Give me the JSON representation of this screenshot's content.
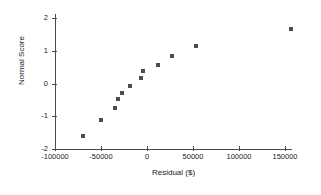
{
  "chart_data": {
    "type": "scatter",
    "title": "",
    "subtitle": "",
    "xlabel": "Residual ($)",
    "ylabel": "Normal Score",
    "xlim": [
      -100000,
      170000
    ],
    "ylim": [
      -2,
      2
    ],
    "xticks": [
      -100000,
      -50000,
      0,
      50000,
      100000,
      150000
    ],
    "xtick_labels": [
      "-100000",
      "-50000",
      "0",
      "50000",
      "100000",
      "150000"
    ],
    "yticks": [
      -2,
      -1,
      0,
      1,
      2
    ],
    "ytick_labels": [
      "-2",
      "-1",
      "0",
      "1",
      "2"
    ],
    "grid": false,
    "legend": null,
    "marker": "square",
    "marker_color": "#4d4d4d",
    "axis_color": "#4a4a4a",
    "points": [
      {
        "x": -70000,
        "y": -1.6
      },
      {
        "x": -50000,
        "y": -1.1
      },
      {
        "x": -35000,
        "y": -0.75
      },
      {
        "x": -31000,
        "y": -0.48
      },
      {
        "x": -27000,
        "y": -0.28
      },
      {
        "x": -18000,
        "y": -0.07
      },
      {
        "x": -7000,
        "y": 0.18
      },
      {
        "x": -4000,
        "y": 0.37
      },
      {
        "x": 12000,
        "y": 0.57
      },
      {
        "x": 27000,
        "y": 0.83
      },
      {
        "x": 53000,
        "y": 1.15
      },
      {
        "x": 157000,
        "y": 1.65
      }
    ],
    "n_points": 12
  }
}
